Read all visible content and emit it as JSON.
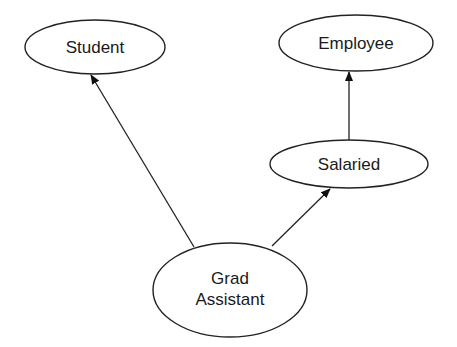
{
  "diagram": {
    "type": "inheritance-graph",
    "nodes": [
      {
        "id": "student",
        "label": "Student",
        "cx": 95,
        "cy": 47,
        "rx": 70,
        "ry": 27
      },
      {
        "id": "employee",
        "label": "Employee",
        "cx": 356,
        "cy": 43,
        "rx": 77,
        "ry": 28
      },
      {
        "id": "salaried",
        "label": "Salaried",
        "cx": 349,
        "cy": 164,
        "rx": 79,
        "ry": 24
      },
      {
        "id": "grad-assistant",
        "label_line1": "Grad",
        "label_line2": "Assistant",
        "cx": 230,
        "cy": 290,
        "rx": 77,
        "ry": 47
      }
    ],
    "edges": [
      {
        "from": "grad-assistant",
        "to": "student"
      },
      {
        "from": "grad-assistant",
        "to": "salaried"
      },
      {
        "from": "salaried",
        "to": "employee"
      }
    ]
  }
}
